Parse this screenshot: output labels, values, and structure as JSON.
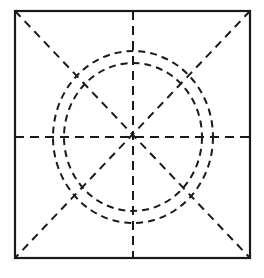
{
  "figure": {
    "background_color": "#ffffff",
    "stroke_color": "#1a1a1a",
    "canvas": {
      "width": 264,
      "height": 278
    },
    "center": {
      "x": 133,
      "y": 137
    },
    "frame": {
      "name": "square-frame",
      "x": 15,
      "y": 11,
      "width": 235,
      "height": 247,
      "stroke_width": 2.2,
      "line_style": "solid",
      "fill": "none"
    },
    "circles": [
      {
        "name": "outer-dashed-circle",
        "cx": 133,
        "cy": 137,
        "rx": 80,
        "ry": 86,
        "stroke_width": 2.0,
        "line_style": "dashed",
        "dash_pattern": "7 5"
      },
      {
        "name": "inner-dashed-circle",
        "cx": 133,
        "cy": 137,
        "rx": 69,
        "ry": 74,
        "stroke_width": 2.0,
        "line_style": "dashed",
        "dash_pattern": "7 5"
      }
    ],
    "radial_lines": [
      {
        "name": "horizontal-center-line",
        "angle_deg": 0,
        "x1": 15,
        "y1": 137,
        "x2": 250,
        "y2": 137,
        "stroke_width": 2.0,
        "line_style": "dashed",
        "dash_pattern": "9 6"
      },
      {
        "name": "vertical-center-line",
        "angle_deg": 90,
        "x1": 133,
        "y1": 11,
        "x2": 133,
        "y2": 258,
        "stroke_width": 2.0,
        "line_style": "dashed",
        "dash_pattern": "9 6"
      },
      {
        "name": "diagonal-line-tl-br",
        "angle_deg": 45,
        "x1": 15,
        "y1": 11,
        "x2": 250,
        "y2": 258,
        "stroke_width": 2.0,
        "line_style": "dashed",
        "dash_pattern": "8 6"
      },
      {
        "name": "diagonal-line-tr-bl",
        "angle_deg": 135,
        "x1": 250,
        "y1": 11,
        "x2": 15,
        "y2": 258,
        "stroke_width": 2.0,
        "line_style": "dashed",
        "dash_pattern": "8 6"
      }
    ],
    "labels": [],
    "annotations": []
  }
}
